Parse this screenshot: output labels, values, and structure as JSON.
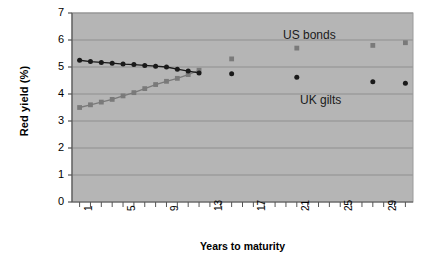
{
  "chart_data": {
    "type": "scatter",
    "title": "",
    "xlabel": "Years to maturity",
    "ylabel": "Red yield (%)",
    "xlim": [
      0.3,
      31.7
    ],
    "ylim": [
      0,
      7
    ],
    "yticks": [
      0,
      1,
      2,
      3,
      4,
      5,
      6,
      7
    ],
    "ytick_labels": [
      "0",
      "1",
      "2",
      "3",
      "4",
      "5",
      "6",
      "7"
    ],
    "xticks": [
      1,
      5,
      9,
      13,
      17,
      21,
      25,
      29
    ],
    "xtick_labels": [
      "1",
      "5",
      "9",
      "13",
      "17",
      "21",
      "25",
      "29"
    ],
    "xtick_minor_step": 1,
    "grid": "horizontal",
    "plot_bgcolor": "#b5b5b5",
    "grid_color": "#8f8f8f",
    "legend_position": "inline-annotations",
    "series": [
      {
        "name": "US bonds",
        "marker": "square",
        "color": "#7a7a7a",
        "connected_until_x": 12,
        "points": [
          {
            "x": 1,
            "y": 3.5
          },
          {
            "x": 2,
            "y": 3.6
          },
          {
            "x": 3,
            "y": 3.7
          },
          {
            "x": 4,
            "y": 3.8
          },
          {
            "x": 5,
            "y": 3.93
          },
          {
            "x": 6,
            "y": 4.05
          },
          {
            "x": 7,
            "y": 4.2
          },
          {
            "x": 8,
            "y": 4.35
          },
          {
            "x": 9,
            "y": 4.47
          },
          {
            "x": 10,
            "y": 4.58
          },
          {
            "x": 11,
            "y": 4.72
          },
          {
            "x": 12,
            "y": 4.88
          },
          {
            "x": 15,
            "y": 5.3
          },
          {
            "x": 21,
            "y": 5.7
          },
          {
            "x": 28,
            "y": 5.8
          },
          {
            "x": 31,
            "y": 5.9
          }
        ]
      },
      {
        "name": "UK gilts",
        "marker": "circle",
        "color": "#1a1a1a",
        "connected_until_x": 12,
        "points": [
          {
            "x": 1,
            "y": 5.25
          },
          {
            "x": 2,
            "y": 5.2
          },
          {
            "x": 3,
            "y": 5.17
          },
          {
            "x": 4,
            "y": 5.14
          },
          {
            "x": 5,
            "y": 5.11
          },
          {
            "x": 6,
            "y": 5.09
          },
          {
            "x": 7,
            "y": 5.06
          },
          {
            "x": 8,
            "y": 5.03
          },
          {
            "x": 9,
            "y": 5.0
          },
          {
            "x": 10,
            "y": 4.92
          },
          {
            "x": 11,
            "y": 4.85
          },
          {
            "x": 12,
            "y": 4.78
          },
          {
            "x": 15,
            "y": 4.75
          },
          {
            "x": 21,
            "y": 4.62
          },
          {
            "x": 28,
            "y": 4.45
          },
          {
            "x": 31,
            "y": 4.4
          }
        ]
      }
    ],
    "annotations": [
      {
        "text": "US bonds",
        "x_px": 283,
        "y_px": 28
      },
      {
        "text": "UK gilts",
        "x_px": 300,
        "y_px": 93
      }
    ]
  }
}
